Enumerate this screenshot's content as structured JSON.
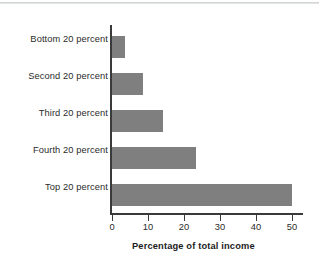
{
  "figure": {
    "background_color": "#ffffff",
    "bar_color": "#7f7f7f",
    "axis_color": "#3a3a3a",
    "text_color": "#2b2b2b"
  },
  "chart_data": {
    "type": "bar",
    "orientation": "horizontal",
    "title": "",
    "subtitle": "",
    "xlabel": "Percentage of total income",
    "ylabel": "",
    "categories": [
      "Bottom 20 percent",
      "Second 20 percent",
      "Third 20 percent",
      "Fourth 20 percent",
      "Top 20 percent"
    ],
    "values": [
      3.6,
      8.6,
      14.2,
      23.3,
      50.0
    ],
    "xlim": [
      0,
      53.5
    ],
    "xticks": [
      0,
      10,
      20,
      30,
      40,
      50
    ],
    "xtick_labels": [
      "0",
      "10",
      "20",
      "30",
      "40",
      "50"
    ],
    "grid": false,
    "legend": null,
    "legend_position": "none",
    "annotations": []
  }
}
